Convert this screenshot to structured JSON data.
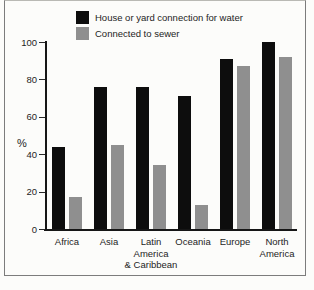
{
  "figure": {
    "background": "#fcfcfa",
    "frame_border_color": "#7c7c7c"
  },
  "chart_data": {
    "type": "bar",
    "title": "",
    "xlabel": "",
    "ylabel": "%",
    "ylim": [
      0,
      100
    ],
    "yticks": [
      0,
      20,
      40,
      60,
      80,
      100
    ],
    "grid": false,
    "legend_position": "top-left-inside",
    "categories": [
      "Africa",
      "Asia",
      "Latin\nAmerica\n& Caribbean",
      "Oceania",
      "Europe",
      "North\nAmerica"
    ],
    "series": [
      {
        "name": "House or yard connection for water",
        "color": "#0d0d0d",
        "values": [
          44,
          76,
          76,
          71,
          91,
          100
        ]
      },
      {
        "name": "Connected to sewer",
        "color": "#8f8f8f",
        "values": [
          17,
          45,
          34,
          13,
          87,
          92
        ]
      }
    ]
  }
}
